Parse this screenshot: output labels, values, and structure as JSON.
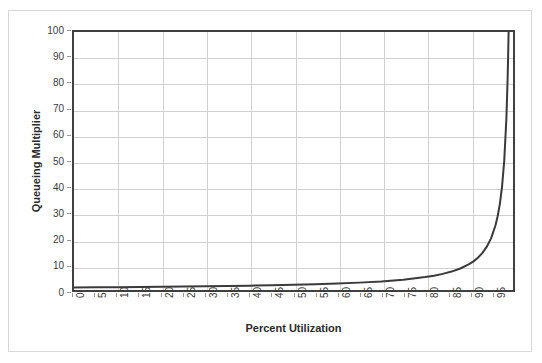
{
  "figure": {
    "background_color": "#ffffff",
    "frame_color": "#d8d8d8",
    "plot_border_color": "#404040",
    "gridline_color": "#d0d0d0",
    "line_color": "#3a3a3a",
    "tick_label_color": "#3b3b3b",
    "axis_title_color": "#2b2b2b"
  },
  "chart_data": {
    "type": "line",
    "title": "",
    "xlabel": "Percent Utilization",
    "ylabel": "Queueing Multiplier",
    "xlim": [
      0,
      100
    ],
    "ylim": [
      0,
      100
    ],
    "grid": true,
    "grid_x_step": 10,
    "grid_y_step": 10,
    "legend": null,
    "x_tick_step": 5,
    "y_tick_step": 10,
    "x_ticks": [
      0,
      5,
      10,
      15,
      20,
      25,
      30,
      35,
      40,
      45,
      50,
      55,
      60,
      65,
      70,
      75,
      80,
      85,
      90,
      95
    ],
    "y_ticks": [
      0,
      10,
      20,
      30,
      40,
      50,
      60,
      70,
      80,
      90,
      100
    ],
    "series": [
      {
        "name": "Queueing Multiplier",
        "formula": "1 / (1 - utilization)",
        "x": [
          0,
          5,
          10,
          15,
          20,
          25,
          30,
          35,
          40,
          45,
          50,
          55,
          60,
          65,
          70,
          75,
          80,
          82,
          84,
          86,
          88,
          90,
          91,
          92,
          93,
          94,
          95,
          96,
          96.5,
          97,
          97.5,
          98,
          98.5,
          98.8,
          99,
          99.2
        ],
        "values": [
          1,
          1.05,
          1.11,
          1.18,
          1.25,
          1.33,
          1.43,
          1.54,
          1.67,
          1.82,
          2,
          2.22,
          2.5,
          2.86,
          3.33,
          4,
          5,
          5.56,
          6.25,
          7.14,
          8.33,
          10,
          11.1,
          12.5,
          14.3,
          16.7,
          20,
          25,
          28.6,
          33.3,
          40,
          50,
          66.7,
          83.3,
          100,
          125
        ]
      }
    ]
  },
  "axes": {
    "y_tick_labels": [
      "100",
      "90",
      "80",
      "70",
      "60",
      "50",
      "40",
      "30",
      "20",
      "10",
      "0"
    ],
    "x_tick_labels": [
      "0",
      "5",
      "10",
      "15",
      "20",
      "25",
      "30",
      "35",
      "40",
      "45",
      "50",
      "55",
      "60",
      "65",
      "70",
      "75",
      "80",
      "85",
      "90",
      "95"
    ],
    "y_axis_title": "Queueing Multiplier",
    "x_axis_title": "Percent Utilization"
  }
}
